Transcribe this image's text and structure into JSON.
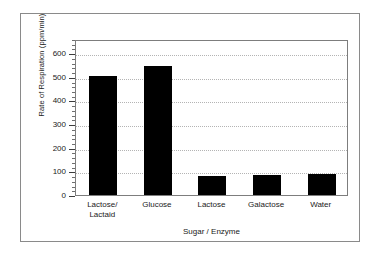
{
  "chart_data": {
    "type": "bar",
    "title": "",
    "subtitle": "",
    "xlabel": "Sugar / Enzyme",
    "ylabel": "Rate of Respiration (ppm/min)",
    "categories": [
      "Lactose/ Lactaid",
      "Glucose",
      "Lactose",
      "Galactose",
      "Water"
    ],
    "category_lines": [
      [
        "Lactose/",
        "Lactaid"
      ],
      [
        "Glucose"
      ],
      [
        "Lactose"
      ],
      [
        "Galactose"
      ],
      [
        "Water"
      ]
    ],
    "values": [
      505,
      545,
      80,
      85,
      90
    ],
    "series": [
      {
        "name": "Rate of Respiration",
        "values": [
          505,
          545,
          80,
          85,
          90
        ],
        "color": "#000000"
      }
    ],
    "ylim": [
      0,
      660
    ],
    "ytick_labels": [
      "0",
      "100",
      "200",
      "300",
      "400",
      "500",
      "600"
    ],
    "ytick_values": [
      0,
      100,
      200,
      300,
      400,
      500,
      600
    ],
    "yminor_interval": 20,
    "grid": "horizontal-dotted",
    "legend": "none",
    "bar_color": "#000000",
    "gridline_color": "#b4b4b4",
    "axis_color": "#7d7d7d",
    "frame_color": "#8a8a8a",
    "background_color": "#ffffff"
  }
}
